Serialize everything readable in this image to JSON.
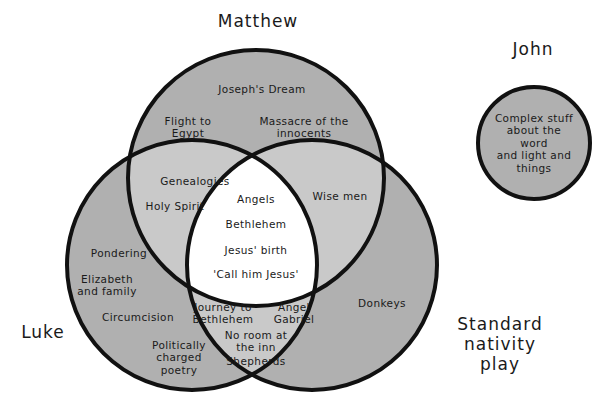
{
  "diagram": {
    "type": "venn",
    "title_labels": {
      "matthew": "Matthew",
      "luke": "Luke",
      "standard": "Standard\nnativity play",
      "john": "John"
    },
    "colors": {
      "outline": "#111111",
      "single_fill": "#b0b0b0",
      "double_fill": "#c9c9c9",
      "triple_fill": "#ffffff",
      "background": "#ffffff",
      "text": "#1a1a1a"
    },
    "sets": [
      {
        "id": "matthew",
        "label": "Matthew",
        "cx": 256,
        "cy": 178,
        "r": 128
      },
      {
        "id": "luke",
        "label": "Luke",
        "cx": 192,
        "cy": 265,
        "r": 125
      },
      {
        "id": "standard",
        "label": "Standard nativity play",
        "cx": 312,
        "cy": 265,
        "r": 125
      },
      {
        "id": "john",
        "label": "John",
        "cx": 534,
        "cy": 143,
        "r": 56
      }
    ],
    "regions": [
      {
        "id": "matthew-only",
        "sets": [
          "matthew"
        ],
        "items": [
          {
            "text": "Joseph's Dream",
            "x": 262,
            "y": 89
          },
          {
            "text": "Flight to\nEgypt",
            "x": 188,
            "y": 127
          },
          {
            "text": "Massacre of the\ninnocents",
            "x": 304,
            "y": 127
          }
        ]
      },
      {
        "id": "matthew-luke",
        "sets": [
          "matthew",
          "luke"
        ],
        "items": [
          {
            "text": "Genealogies",
            "x": 195,
            "y": 181
          },
          {
            "text": "Holy Spirit",
            "x": 175,
            "y": 206
          }
        ]
      },
      {
        "id": "matthew-standard",
        "sets": [
          "matthew",
          "standard"
        ],
        "items": [
          {
            "text": "Wise men",
            "x": 340,
            "y": 196
          }
        ]
      },
      {
        "id": "all-three",
        "sets": [
          "matthew",
          "luke",
          "standard"
        ],
        "items": [
          {
            "text": "Angels",
            "x": 256,
            "y": 199
          },
          {
            "text": "Bethlehem",
            "x": 256,
            "y": 224
          },
          {
            "text": "Jesus' birth",
            "x": 256,
            "y": 250
          },
          {
            "text": "'Call him Jesus'",
            "x": 256,
            "y": 274
          }
        ]
      },
      {
        "id": "luke-standard",
        "sets": [
          "luke",
          "standard"
        ],
        "items": [
          {
            "text": "Journey to\nBethlehem",
            "x": 223,
            "y": 313
          },
          {
            "text": "Angel\nGabriel",
            "x": 294,
            "y": 313
          },
          {
            "text": "No room at\nthe inn",
            "x": 256,
            "y": 341
          },
          {
            "text": "Shepherds",
            "x": 256,
            "y": 361
          }
        ]
      },
      {
        "id": "luke-only",
        "sets": [
          "luke"
        ],
        "items": [
          {
            "text": "Pondering",
            "x": 119,
            "y": 253
          },
          {
            "text": "Elizabeth\nand family",
            "x": 107,
            "y": 285
          },
          {
            "text": "Circumcision",
            "x": 138,
            "y": 317
          },
          {
            "text": "Politically\ncharged\npoetry",
            "x": 179,
            "y": 358
          }
        ]
      },
      {
        "id": "standard-only",
        "sets": [
          "standard"
        ],
        "items": [
          {
            "text": "Donkeys",
            "x": 382,
            "y": 303
          }
        ]
      },
      {
        "id": "john-only",
        "sets": [
          "john"
        ],
        "items": [
          {
            "text": "Complex stuff\nabout the word\nand light and\nthings",
            "x": 534,
            "y": 143
          }
        ]
      }
    ],
    "set_title_positions": {
      "matthew": {
        "x": 258,
        "y": 21
      },
      "luke": {
        "x": 43,
        "y": 332
      },
      "standard": {
        "x": 500,
        "y": 344
      },
      "john": {
        "x": 533,
        "y": 49
      }
    }
  }
}
